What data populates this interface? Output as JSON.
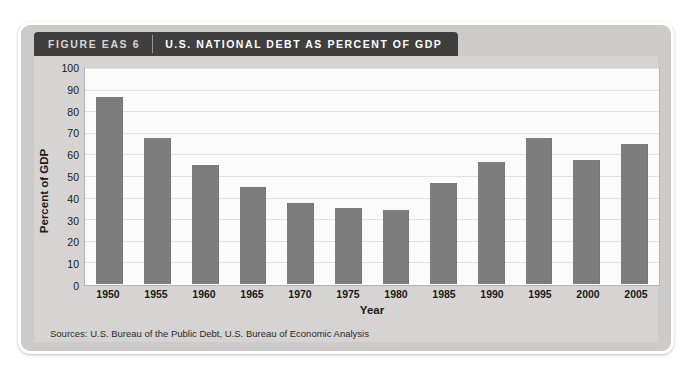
{
  "figure": {
    "number_label": "FIGURE EAS 6",
    "title": "U.S. NATIONAL DEBT AS PERCENT OF GDP",
    "sources": "Sources: U.S. Bureau of the Public Debt, U.S. Bureau of Economic Analysis"
  },
  "chart_data": {
    "type": "bar",
    "title": "U.S. NATIONAL DEBT AS PERCENT OF GDP",
    "xlabel": "Year",
    "ylabel": "Percent of GDP",
    "ylim": [
      0,
      100
    ],
    "ytick_step": 10,
    "yticks": [
      0,
      10,
      20,
      30,
      40,
      50,
      60,
      70,
      80,
      90,
      100
    ],
    "grid": true,
    "legend": "none",
    "bar_color": "#7d7d7d",
    "categories": [
      "1950",
      "1955",
      "1960",
      "1965",
      "1970",
      "1975",
      "1980",
      "1985",
      "1990",
      "1995",
      "2000",
      "2005"
    ],
    "values": [
      87.5,
      68,
      55.5,
      45.5,
      38,
      35.5,
      34.5,
      47,
      57,
      68,
      58,
      65.5
    ]
  }
}
